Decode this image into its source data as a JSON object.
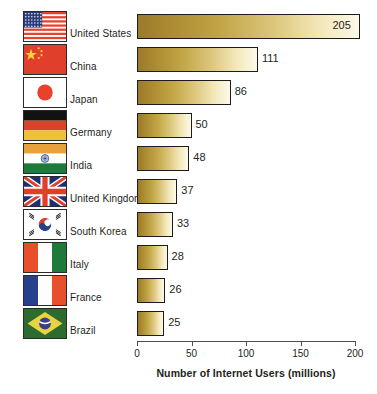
{
  "chart_data": {
    "type": "bar",
    "orientation": "horizontal",
    "title": "",
    "xlabel": "Number of Internet Users (millions)",
    "ylabel": "",
    "xlim": [
      0,
      200
    ],
    "xticks": [
      0,
      50,
      100,
      150,
      200
    ],
    "xtick_labels": [
      "0",
      "50",
      "100",
      "150",
      "200"
    ],
    "grid": false,
    "legend": false,
    "categories": [
      "United States",
      "China",
      "Japan",
      "Germany",
      "India",
      "United Kingdom",
      "South Korea",
      "Italy",
      "France",
      "Brazil"
    ],
    "values": [
      205,
      111,
      86,
      50,
      48,
      37,
      33,
      28,
      26,
      25
    ],
    "value_labels": [
      "205",
      "111",
      "86",
      "50",
      "48",
      "37",
      "33",
      "28",
      "26",
      "25"
    ],
    "bar_gradient": {
      "start": "#9a7a2c",
      "end": "#fdf9ea"
    },
    "bar_border": "#1c1c1c",
    "axis_color": "#4d4d4d",
    "text_color": "#231f20",
    "background": "#ffffff"
  },
  "rows": [
    {
      "country": "United States",
      "value": 205,
      "label": "205",
      "flag": "flag-united-states",
      "label_inside": true
    },
    {
      "country": "China",
      "value": 111,
      "label": "111",
      "flag": "flag-china",
      "label_inside": false
    },
    {
      "country": "Japan",
      "value": 86,
      "label": "86",
      "flag": "flag-japan",
      "label_inside": false
    },
    {
      "country": "Germany",
      "value": 50,
      "label": "50",
      "flag": "flag-germany",
      "label_inside": false
    },
    {
      "country": "India",
      "value": 48,
      "label": "48",
      "flag": "flag-india",
      "label_inside": false
    },
    {
      "country": "United Kingdom",
      "value": 37,
      "label": "37",
      "flag": "flag-united-kingdom",
      "label_inside": false
    },
    {
      "country": "South Korea",
      "value": 33,
      "label": "33",
      "flag": "flag-south-korea",
      "label_inside": false
    },
    {
      "country": "Italy",
      "value": 28,
      "label": "28",
      "flag": "flag-italy",
      "label_inside": false
    },
    {
      "country": "France",
      "value": 26,
      "label": "26",
      "flag": "flag-france",
      "label_inside": false
    },
    {
      "country": "Brazil",
      "value": 25,
      "label": "25",
      "flag": "flag-brazil",
      "label_inside": false
    }
  ],
  "axis": {
    "ticks": [
      {
        "value": 0,
        "label": "0"
      },
      {
        "value": 50,
        "label": "50"
      },
      {
        "value": 100,
        "label": "100"
      },
      {
        "value": 150,
        "label": "150"
      },
      {
        "value": 200,
        "label": "200"
      }
    ],
    "title": "Number of Internet Users (millions)"
  }
}
